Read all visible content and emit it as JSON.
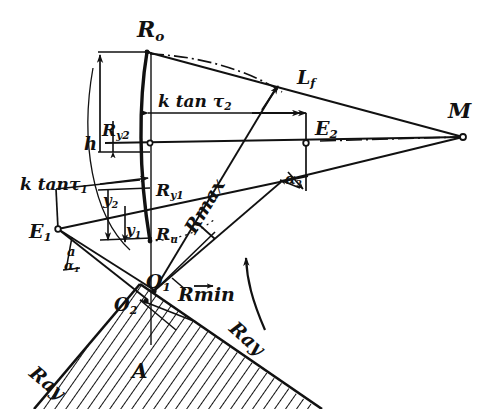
{
  "figure": {
    "background_color": "#ffffff",
    "ink_color": "#111111",
    "width": 484,
    "height": 409
  },
  "labels": {
    "R0": "R",
    "R0_sub": "o",
    "Ry2": "R",
    "Ry2_sub": "y2",
    "Ry1": "R",
    "Ry1_sub": "y1",
    "Ru": "R",
    "Ru_sub": "u",
    "h": "h",
    "y2": "y",
    "y2_sub": "2",
    "y1": "y",
    "y1_sub": "1",
    "ktan_tau2": "k tan τ",
    "ktan_tau2_sub": "2",
    "ktan_tau1": "k tanτ",
    "ktan_tau1_sub": "1",
    "E1": "E",
    "E1_sub": "1",
    "E2": "E",
    "E2_sub": "2",
    "Lf": "L",
    "Lf_sub": "f",
    "M": "M",
    "alpha1": "α",
    "alpha1_sub": "1",
    "alpha1_upper": "a",
    "alpha2": "α",
    "alpha2_sub": "2",
    "Rmax": "Rmax",
    "Rmin": "Rmin",
    "Rmin_accent": "→",
    "O1": "O",
    "O1_sub": "1",
    "O2": "O",
    "O2_sub": "2",
    "A": "A",
    "ray_left": "Ray",
    "ray_right": "Ray"
  },
  "annotations": {
    "hatched_region_label": "A",
    "rotation_arrow": "curved-up-arrow",
    "center_point": "M",
    "axis_line_style": "dash-dot"
  }
}
